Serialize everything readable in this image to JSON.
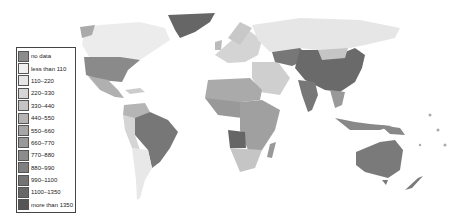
{
  "map": {
    "type": "choropleth",
    "region": "world",
    "countries": [
      {
        "name": "Greenland",
        "bin": 11
      },
      {
        "name": "Canada",
        "bin": 1
      },
      {
        "name": "USA",
        "bin": 8
      },
      {
        "name": "Mexico",
        "bin": 5
      },
      {
        "name": "Brazil",
        "bin": 10
      },
      {
        "name": "Colombia/Venezuela",
        "bin": 4
      },
      {
        "name": "Argentina/Chile",
        "bin": 1
      },
      {
        "name": "Russia",
        "bin": 1
      },
      {
        "name": "China",
        "bin": 11
      },
      {
        "name": "Mongolia",
        "bin": 3
      },
      {
        "name": "Kazakhstan",
        "bin": 10
      },
      {
        "name": "India",
        "bin": 10
      },
      {
        "name": "Australia",
        "bin": 9
      },
      {
        "name": "New Zealand",
        "bin": 9
      },
      {
        "name": "Angola",
        "bin": 11
      },
      {
        "name": "Africa (other)",
        "bin": 6
      },
      {
        "name": "South Africa",
        "bin": 3
      },
      {
        "name": "Europe",
        "bin": 3
      },
      {
        "name": "Middle East",
        "bin": 3
      },
      {
        "name": "Indonesia",
        "bin": 8
      }
    ]
  },
  "legend": {
    "items": [
      {
        "label": "no data",
        "color": "#8c8c8c"
      },
      {
        "label": "less than 110",
        "color": "#f0f0f0"
      },
      {
        "label": "110–220",
        "color": "#e6e6e6"
      },
      {
        "label": "220–330",
        "color": "#d6d6d6"
      },
      {
        "label": "330–440",
        "color": "#c4c4c4"
      },
      {
        "label": "440–550",
        "color": "#b4b4b4"
      },
      {
        "label": "550–660",
        "color": "#a6a6a6"
      },
      {
        "label": "660–770",
        "color": "#999999"
      },
      {
        "label": "770–880",
        "color": "#8c8c8c"
      },
      {
        "label": "880–990",
        "color": "#808080"
      },
      {
        "label": "990–1100",
        "color": "#747474"
      },
      {
        "label": "1100–1350",
        "color": "#686868"
      },
      {
        "label": "more than 1350",
        "color": "#555555"
      }
    ]
  }
}
